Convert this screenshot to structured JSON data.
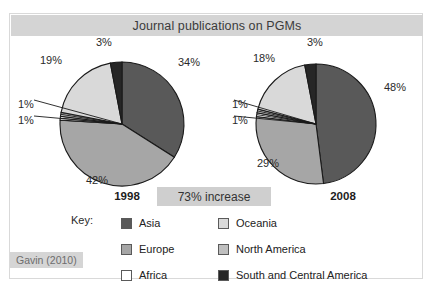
{
  "figure": {
    "title": "Journal publications on PGMs",
    "citation": "Gavin (2010)",
    "increase_banner": "73% increase",
    "key_label": "Key:"
  },
  "palette": {
    "asia": "#595959",
    "europe": "#a6a6a6",
    "africa": "#ffffff",
    "oceania": "#d9d9d9",
    "north_america": "#bfbfbf",
    "south_and_central_america": "#262626",
    "outline": "#1a1a1a",
    "title_band": "#d4d4d4",
    "banner": "#cfcfcf",
    "citation_bg": "#d5d5d5"
  },
  "legend": {
    "columns": [
      [
        {
          "label": "Asia",
          "color": "#595959"
        },
        {
          "label": "Europe",
          "color": "#a6a6a6"
        },
        {
          "label": "Africa",
          "color": "#ffffff"
        }
      ],
      [
        {
          "label": "Oceania",
          "color": "#d9d9d9"
        },
        {
          "label": "North America",
          "color": "#bfbfbf"
        },
        {
          "label": "South and Central America",
          "color": "#262626"
        }
      ]
    ]
  },
  "charts": [
    {
      "id": "pie-1998",
      "year": "1998",
      "labels": [
        "34%",
        "42%",
        "1%",
        "1%",
        "19%",
        "3%"
      ],
      "label_positions": [
        {
          "text": "34%",
          "left": 168,
          "top": 42
        },
        {
          "text": "42%",
          "left": 76,
          "top": 160
        },
        {
          "text": "1%",
          "left": 8,
          "top": 84
        },
        {
          "text": "1%",
          "left": 8,
          "top": 100
        },
        {
          "text": "19%",
          "left": 30,
          "top": 40
        },
        {
          "text": "3%",
          "left": 86,
          "top": 22
        }
      ]
    },
    {
      "id": "pie-2008",
      "year": "2008",
      "labels": [
        "48%",
        "29%",
        "1%",
        "1%",
        "18%",
        "3%"
      ],
      "label_positions": [
        {
          "text": "48%",
          "left": 374,
          "top": 67
        },
        {
          "text": "29%",
          "left": 247,
          "top": 143
        },
        {
          "text": "1%",
          "left": 222,
          "top": 84
        },
        {
          "text": "1%",
          "left": 222,
          "top": 100
        },
        {
          "text": "18%",
          "left": 243,
          "top": 38
        },
        {
          "text": "3%",
          "left": 297,
          "top": 22
        }
      ]
    }
  ],
  "chart_data": {
    "type": "pie",
    "title": "Journal publications on PGMs",
    "annotation": "73% increase",
    "source": "Gavin (2010)",
    "categories": [
      "Asia",
      "Europe",
      "Africa",
      "North America",
      "Oceania",
      "South and Central America"
    ],
    "colors": [
      "#595959",
      "#a6a6a6",
      "#ffffff",
      "#bfbfbf",
      "#d9d9d9",
      "#262626"
    ],
    "unit": "percent",
    "series": [
      {
        "name": "1998",
        "values": [
          34,
          42,
          1,
          1,
          19,
          3
        ]
      },
      {
        "name": "2008",
        "values": [
          48,
          29,
          1,
          1,
          18,
          3
        ]
      }
    ],
    "legend_position": "bottom",
    "grid": false
  }
}
